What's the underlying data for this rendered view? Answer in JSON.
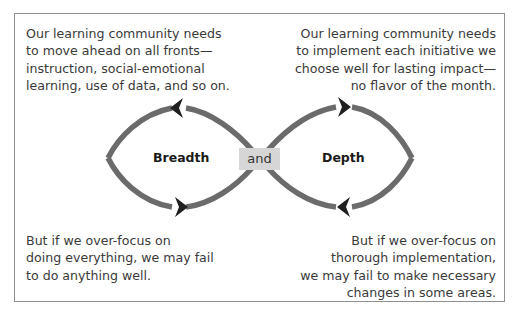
{
  "diagram": {
    "top_left": "Our learning community needs\nto move ahead on all fronts—\ninstruction, social-emotional\nlearning, use of data, and so on.",
    "top_right": "Our learning community needs\nto implement each initiative we\nchoose well for lasting impact—\nno flavor of the month.",
    "bottom_left": "But if we over-focus on\ndoing everything, we may fail\nto do anything well.",
    "bottom_right": "But if we over-focus on\nthorough implementation,\nwe may fail to make necessary\nchanges in some areas.",
    "left_label": "Breadth",
    "center_label": "and",
    "right_label": "Depth",
    "colors": {
      "loop": "#6b6b6b",
      "arrow": "#1f1f1f",
      "and_bg": "#d6d6d6",
      "frame": "#8f8f8f"
    }
  }
}
